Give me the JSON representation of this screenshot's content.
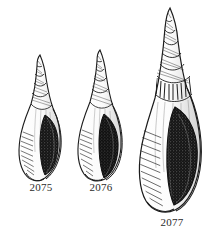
{
  "plate": {
    "background_color": "#ffffff",
    "ink_color": "#1c1c1c",
    "label_color": "#2b2b2b",
    "style": "engraving",
    "subject": "gastropod-shells"
  },
  "figures": [
    {
      "id": "2075",
      "label": "2075",
      "name": "shell-illustration-2075",
      "size": "small",
      "whorl_count": 6,
      "aperture": "dark-elongate-oval",
      "aperture_fill": "#141414",
      "outline_color": "#1c1c1c"
    },
    {
      "id": "2076",
      "label": "2076",
      "name": "shell-illustration-2076",
      "size": "medium",
      "whorl_count": 6,
      "aperture": "dark-elongate-oval",
      "aperture_fill": "#111111",
      "outline_color": "#1c1c1c"
    },
    {
      "id": "2077",
      "label": "2077",
      "name": "shell-illustration-2077",
      "size": "large",
      "whorl_count": 8,
      "aperture": "dark-broad-oval",
      "aperture_fill": "#141414",
      "outline_color": "#1c1c1c"
    }
  ]
}
